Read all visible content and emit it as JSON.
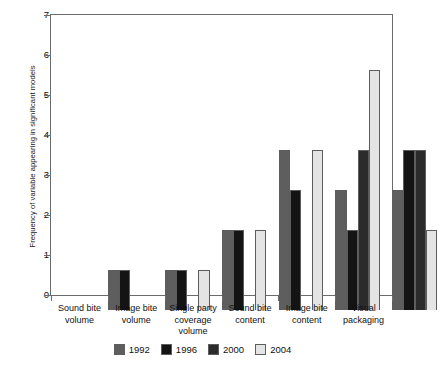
{
  "chart_data": {
    "type": "bar",
    "title": "",
    "subtitle": "",
    "xlabel": "",
    "ylabel": "Frequency of variable appearing in significant models",
    "ylim": [
      0,
      7
    ],
    "yticks": [
      0,
      1,
      2,
      3,
      4,
      5,
      6,
      7
    ],
    "grid": false,
    "legend_position": "bottom",
    "categories": [
      "Sound bite\nvolume",
      "Image bite\nvolume",
      "Single party\ncoverage\nvolume",
      "Sound bite\ncontent",
      "Image bite\ncontent",
      "Visual\npackaging"
    ],
    "series": [
      {
        "name": "1992",
        "color": "#5e5e5e",
        "values": [
          1,
          1,
          2,
          4,
          3,
          3
        ]
      },
      {
        "name": "1996",
        "color": "#141414",
        "values": [
          1,
          1,
          2,
          3,
          2,
          4
        ]
      },
      {
        "name": "2000",
        "color": "#2b2b2b",
        "values": [
          0,
          0,
          0,
          0,
          4,
          4
        ]
      },
      {
        "name": "2004",
        "color": "#e4e4e4",
        "values": [
          0,
          1,
          2,
          4,
          6,
          2
        ]
      }
    ]
  },
  "legend": {
    "items": [
      {
        "label": "1992",
        "color": "#5e5e5e"
      },
      {
        "label": "1996",
        "color": "#141414"
      },
      {
        "label": "2000",
        "color": "#2b2b2b"
      },
      {
        "label": "2004",
        "color": "#e4e4e4"
      }
    ]
  },
  "axis": {
    "y_title": "Frequency of variable appearing in significant models",
    "y_tick_labels": [
      "0",
      "1",
      "2",
      "3",
      "4",
      "5",
      "6",
      "7"
    ]
  },
  "colors": {
    "axis_line": "#6b6b6b",
    "bar_outline": "#5d5d5d",
    "text": "#111111",
    "background": "#ffffff"
  }
}
